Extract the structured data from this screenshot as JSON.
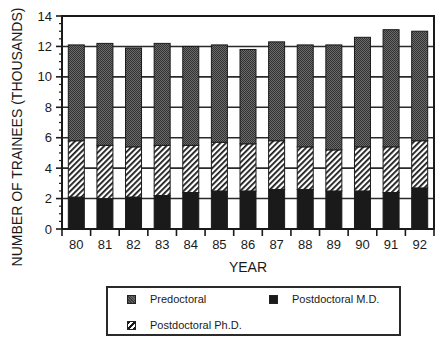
{
  "chart_data": {
    "type": "bar",
    "stacked": true,
    "title": "",
    "xlabel": "YEAR",
    "ylabel": "NUMBER OF TRAINEES (THOUSANDS)",
    "ylim": [
      0,
      14
    ],
    "yticks": [
      0,
      2,
      4,
      6,
      8,
      10,
      12,
      14
    ],
    "grid": "horizontal",
    "legend_position": "bottom",
    "categories": [
      "80",
      "81",
      "82",
      "83",
      "84",
      "85",
      "86",
      "87",
      "88",
      "89",
      "90",
      "91",
      "92"
    ],
    "series": [
      {
        "name": "Postdoctoral M.D.",
        "pattern": "solid-black",
        "color": "#1a1a1a",
        "values": [
          2.1,
          2.0,
          2.1,
          2.2,
          2.4,
          2.5,
          2.5,
          2.6,
          2.6,
          2.5,
          2.5,
          2.4,
          2.7
        ]
      },
      {
        "name": "Postdoctoral Ph.D.",
        "pattern": "diagonal-hatch",
        "color": "#ffffff",
        "values": [
          3.7,
          3.5,
          3.3,
          3.3,
          3.1,
          3.2,
          3.1,
          3.2,
          2.8,
          2.7,
          2.9,
          3.0,
          3.1
        ]
      },
      {
        "name": "Predoctoral",
        "pattern": "stipple-gray",
        "color": "#555555",
        "values": [
          6.3,
          6.7,
          6.5,
          6.7,
          6.5,
          6.4,
          6.2,
          6.5,
          6.7,
          6.9,
          7.2,
          7.7,
          7.2
        ]
      }
    ],
    "totals": [
      12.1,
      12.2,
      11.9,
      12.2,
      12.0,
      12.1,
      11.8,
      12.3,
      12.1,
      12.1,
      12.6,
      13.1,
      13.0
    ]
  },
  "legend": {
    "items": [
      {
        "label": "Predoctoral",
        "key": "predoc"
      },
      {
        "label": "Postdoctoral M.D.",
        "key": "md"
      },
      {
        "label": "Postdoctoral Ph.D.",
        "key": "phd"
      }
    ]
  }
}
